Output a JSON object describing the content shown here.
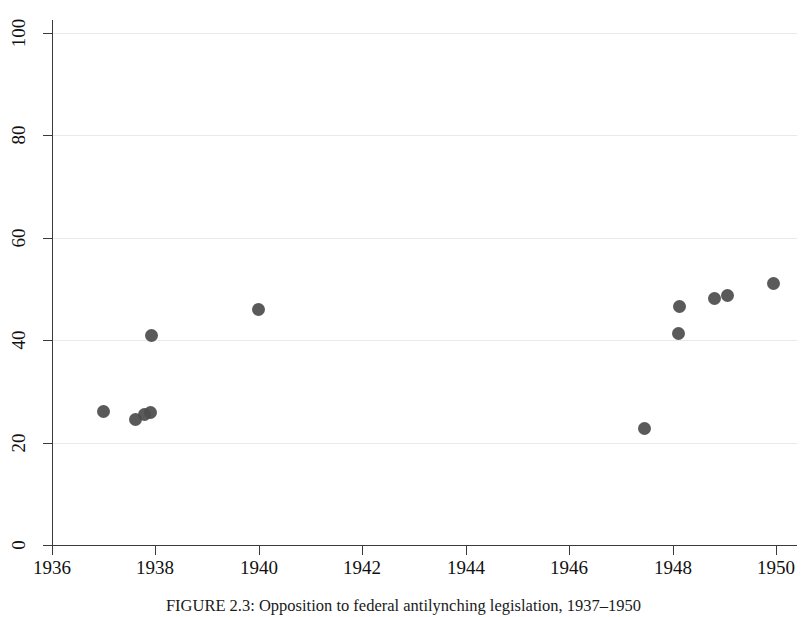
{
  "figure": {
    "caption_label": "FIGURE 2.3:",
    "caption_text": "Opposition to federal antilynching legislation, 1937–1950"
  },
  "chart_data": {
    "type": "scatter",
    "title": "",
    "subtitle": "",
    "xlabel": "",
    "ylabel": "",
    "xlim": [
      1936,
      1950.4
    ],
    "ylim": [
      0,
      100
    ],
    "grid": true,
    "grid_axis": "y",
    "legend": "none",
    "marker": {
      "shape": "circle",
      "color": "#4e4e4e",
      "size_px": 13
    },
    "xticks": [
      1936,
      1938,
      1940,
      1942,
      1944,
      1946,
      1948,
      1950
    ],
    "xticklabels": [
      "1936",
      "1938",
      "1940",
      "1942",
      "1944",
      "1946",
      "1948",
      "1950"
    ],
    "yticks": [
      0,
      20,
      40,
      60,
      80,
      100
    ],
    "yticklabels": [
      "0",
      "20",
      "40",
      "60",
      "80",
      "100"
    ],
    "series": [
      {
        "name": "Opposition (%)",
        "points": [
          {
            "x": 1937.0,
            "y": 26.0
          },
          {
            "x": 1937.62,
            "y": 24.5
          },
          {
            "x": 1937.78,
            "y": 25.5
          },
          {
            "x": 1937.9,
            "y": 25.8
          },
          {
            "x": 1937.92,
            "y": 41.0
          },
          {
            "x": 1940.0,
            "y": 46.0
          },
          {
            "x": 1947.45,
            "y": 22.8
          },
          {
            "x": 1948.1,
            "y": 41.3
          },
          {
            "x": 1948.12,
            "y": 46.6
          },
          {
            "x": 1948.8,
            "y": 48.2
          },
          {
            "x": 1949.05,
            "y": 48.7
          },
          {
            "x": 1949.95,
            "y": 51.0
          }
        ]
      }
    ]
  }
}
